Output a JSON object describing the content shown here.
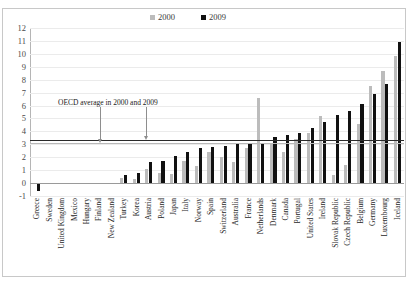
{
  "legend": {
    "position": "top-center",
    "items": [
      {
        "label": "2000",
        "color": "#bcbcbc"
      },
      {
        "label": "2009",
        "color": "#111111"
      }
    ]
  },
  "annotation": {
    "text": "OECD average in 2000 and 2009"
  },
  "axis": {
    "y_ticks": [
      "12",
      "11",
      "10",
      "9",
      "8",
      "7",
      "6",
      "5",
      "4",
      "3",
      "2",
      "1",
      "0",
      "-1"
    ]
  },
  "chart_data": {
    "type": "bar",
    "title": "",
    "xlabel": "",
    "ylabel": "",
    "ylim": [
      -1,
      12
    ],
    "grid": true,
    "legend_position": "top-center",
    "annotations": [
      {
        "text": "OECD average in 2000 and 2009",
        "series": "2000",
        "value": 3.1
      },
      {
        "text": "OECD average in 2000 and 2009",
        "series": "2009",
        "value": 3.3
      }
    ],
    "reference_lines": [
      {
        "name": "OECD average 2000",
        "value": 3.1,
        "color": "#bcbcbc"
      },
      {
        "name": "OECD average 2009",
        "value": 3.3,
        "color": "#2b2b2b"
      }
    ],
    "categories": [
      "Greece",
      "Sweden",
      "United Kingdom",
      "Mexico",
      "Hungary",
      "Finland",
      "New Zealand",
      "Turkey",
      "Korea",
      "Austria",
      "Poland",
      "Japan",
      "Italy",
      "Norway",
      "Spain",
      "Switzerland",
      "Australia",
      "France",
      "Netherlands",
      "Denmark",
      "Canada",
      "Portugal",
      "United States",
      "Ireland",
      "Slovak Republic",
      "Czech Republic",
      "Belgium",
      "Germany",
      "Luxembourg",
      "Iceland"
    ],
    "series": [
      {
        "name": "2000",
        "color": "#bcbcbc",
        "values": [
          0.0,
          0.0,
          0.0,
          0.0,
          0.0,
          0.0,
          0.0,
          0.4,
          0.3,
          1.1,
          0.8,
          0.7,
          1.7,
          1.3,
          2.4,
          2.0,
          1.6,
          2.7,
          6.6,
          3.1,
          2.4,
          3.4,
          3.9,
          5.2,
          0.6,
          1.4,
          4.6,
          7.5,
          8.7,
          9.8
        ]
      },
      {
        "name": "2009",
        "color": "#111111",
        "values": [
          -0.6,
          0.0,
          0.0,
          0.0,
          0.0,
          0.0,
          0.0,
          0.6,
          0.8,
          1.6,
          1.7,
          2.1,
          2.4,
          2.7,
          2.8,
          2.9,
          3.0,
          3.0,
          3.1,
          3.6,
          3.7,
          3.9,
          4.3,
          4.7,
          5.3,
          5.6,
          6.1,
          6.9,
          7.7,
          10.9
        ]
      }
    ]
  }
}
